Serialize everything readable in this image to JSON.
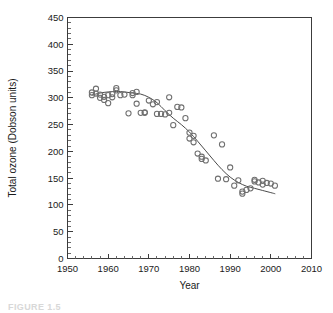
{
  "figure": {
    "caption": "FIGURE 1.5"
  },
  "chart_data": {
    "type": "scatter",
    "title": "",
    "xlabel": "Year",
    "ylabel": "Total ozone (Dobson units)",
    "xlim": [
      1950,
      2010
    ],
    "ylim": [
      0,
      450
    ],
    "x_major_ticks": [
      1950,
      1960,
      1970,
      1980,
      1990,
      2000,
      2010
    ],
    "x_tick_labels": [
      "1950",
      "1960",
      "1970",
      "1980",
      "1990",
      "2000",
      "2010"
    ],
    "x_minor_step": 2,
    "y_major_ticks": [
      0,
      50,
      100,
      150,
      200,
      250,
      300,
      350,
      400,
      450
    ],
    "y_tick_labels": [
      "0",
      "50",
      "100",
      "150",
      "200",
      "250",
      "300",
      "350",
      "400",
      "450"
    ],
    "y_minor_step": 10,
    "grid": false,
    "legend": "none",
    "marker": "open-circle",
    "marker_radius_px": 2.6,
    "series": [
      {
        "name": "Total ozone observations",
        "type": "scatter",
        "points": [
          [
            1956,
            310
          ],
          [
            1956,
            305
          ],
          [
            1957,
            317
          ],
          [
            1957,
            308
          ],
          [
            1958,
            306
          ],
          [
            1958,
            300
          ],
          [
            1959,
            302
          ],
          [
            1959,
            296
          ],
          [
            1960,
            290
          ],
          [
            1960,
            305
          ],
          [
            1961,
            307
          ],
          [
            1961,
            301
          ],
          [
            1962,
            318
          ],
          [
            1962,
            314
          ],
          [
            1963,
            305
          ],
          [
            1964,
            306
          ],
          [
            1965,
            271
          ],
          [
            1966,
            309
          ],
          [
            1966,
            305
          ],
          [
            1967,
            311
          ],
          [
            1967,
            289
          ],
          [
            1968,
            272
          ],
          [
            1969,
            273
          ],
          [
            1969,
            272
          ],
          [
            1970,
            295
          ],
          [
            1971,
            288
          ],
          [
            1972,
            292
          ],
          [
            1972,
            270
          ],
          [
            1973,
            270
          ],
          [
            1974,
            269
          ],
          [
            1975,
            301
          ],
          [
            1975,
            272
          ],
          [
            1976,
            249
          ],
          [
            1977,
            283
          ],
          [
            1978,
            282
          ],
          [
            1979,
            262
          ],
          [
            1980,
            235
          ],
          [
            1980,
            224
          ],
          [
            1981,
            229
          ],
          [
            1981,
            217
          ],
          [
            1982,
            196
          ],
          [
            1983,
            190
          ],
          [
            1983,
            186
          ],
          [
            1984,
            183
          ],
          [
            1986,
            230
          ],
          [
            1987,
            149
          ],
          [
            1988,
            213
          ],
          [
            1989,
            148
          ],
          [
            1990,
            170
          ],
          [
            1991,
            136
          ],
          [
            1992,
            146
          ],
          [
            1993,
            121
          ],
          [
            1993,
            125
          ],
          [
            1994,
            128
          ],
          [
            1995,
            131
          ],
          [
            1996,
            147
          ],
          [
            1996,
            144
          ],
          [
            1997,
            142
          ],
          [
            1998,
            138
          ],
          [
            1998,
            145
          ],
          [
            1999,
            141
          ],
          [
            2000,
            140
          ],
          [
            2001,
            136
          ]
        ]
      },
      {
        "name": "Smoothed trend",
        "type": "line",
        "points": [
          [
            1956,
            305
          ],
          [
            1958,
            309
          ],
          [
            1960,
            311
          ],
          [
            1962,
            312
          ],
          [
            1964,
            311
          ],
          [
            1966,
            309
          ],
          [
            1968,
            307
          ],
          [
            1970,
            301
          ],
          [
            1972,
            291
          ],
          [
            1974,
            276
          ],
          [
            1976,
            262
          ],
          [
            1978,
            250
          ],
          [
            1980,
            236
          ],
          [
            1982,
            219
          ],
          [
            1984,
            201
          ],
          [
            1986,
            183
          ],
          [
            1988,
            166
          ],
          [
            1990,
            152
          ],
          [
            1992,
            142
          ],
          [
            1994,
            135
          ],
          [
            1996,
            131
          ],
          [
            1998,
            127
          ],
          [
            2000,
            123
          ],
          [
            2001,
            121
          ]
        ]
      }
    ]
  }
}
